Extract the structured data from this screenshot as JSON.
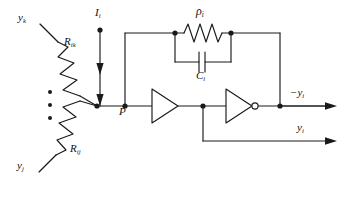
{
  "figure": {
    "type": "analog-neural-circuit-schematic",
    "background_color": "#ffffff",
    "line_color": "#1a1a1a",
    "width": 347,
    "height": 200
  },
  "labels": {
    "input_top": "y",
    "input_top_sub": "k",
    "input_bottom": "y",
    "input_bottom_sub": "j",
    "resistor_top": "R",
    "resistor_top_sub": "ik",
    "resistor_bottom": "R",
    "resistor_bottom_sub": "ij",
    "current_source": "I",
    "current_source_sub": "i",
    "node_p": "P",
    "feedback_resistor": "ρ",
    "feedback_resistor_sub": "i",
    "feedback_capacitor": "C",
    "feedback_capacitor_sub": "i",
    "output_inverted": "−y",
    "output_inverted_sub": "i",
    "output_direct": "y",
    "output_direct_sub": "i",
    "ellipsis": "⋮"
  },
  "components": [
    {
      "name": "resistor-rik",
      "kind": "resistor",
      "label": "R_ik",
      "orientation": "diagonal"
    },
    {
      "name": "resistor-rij",
      "kind": "resistor",
      "label": "R_ij",
      "orientation": "diagonal"
    },
    {
      "name": "current-source-ii",
      "kind": "current-arrow",
      "label": "I_i",
      "direction": "down"
    },
    {
      "name": "resistor-rho-i",
      "kind": "resistor",
      "label": "rho_i",
      "orientation": "horizontal"
    },
    {
      "name": "capacitor-ci",
      "kind": "capacitor",
      "label": "C_i",
      "orientation": "horizontal"
    },
    {
      "name": "amplifier-stage-1",
      "kind": "amplifier",
      "inverting": false
    },
    {
      "name": "amplifier-stage-2",
      "kind": "amplifier",
      "inverting": true
    }
  ],
  "nodes": [
    {
      "name": "summing-node",
      "label": ""
    },
    {
      "name": "node-p",
      "label": "P"
    },
    {
      "name": "feedback-left-node",
      "label": ""
    },
    {
      "name": "feedback-right-node",
      "label": ""
    },
    {
      "name": "interstage-node",
      "label": ""
    },
    {
      "name": "output-node",
      "label": ""
    }
  ]
}
